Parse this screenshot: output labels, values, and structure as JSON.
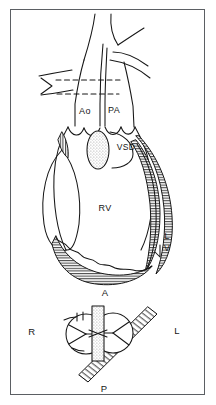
{
  "figure": {
    "caption": "",
    "border_color": "#5b5f63",
    "ink_color": "#161616",
    "background_color": "#ffffff",
    "hatch_color": "#2b2b2b",
    "stipple_color": "#9a9a9a"
  },
  "upper_panel": {
    "name": "heart-anterior-view",
    "labels": [
      {
        "id": "ao",
        "text": "Ao",
        "x": 85,
        "y": 112,
        "meaning": "aorta"
      },
      {
        "id": "pa",
        "text": "PA",
        "x": 114,
        "y": 111,
        "meaning": "pulmonary-artery"
      },
      {
        "id": "vsd",
        "text": "VSD",
        "x": 126,
        "y": 148,
        "meaning": "ventricular-septal-defect"
      },
      {
        "id": "rv",
        "text": "RV",
        "x": 105,
        "y": 209,
        "meaning": "right-ventricle"
      }
    ],
    "stacked_labels": [
      {
        "id": "lv",
        "lines": [
          "L",
          "V"
        ],
        "x": 167,
        "y": 243,
        "meaning": "left-ventricle"
      }
    ],
    "markers": [
      {
        "id": "level-arrow",
        "shape": "chevron-right",
        "x": 46,
        "y": 85,
        "meaning": "section-level-indicator"
      },
      {
        "id": "dashed-plane-upper",
        "shape": "dashed-line",
        "meaning": "sectioning-plane"
      },
      {
        "id": "dashed-plane-lower",
        "shape": "dashed-line",
        "meaning": "sectioning-plane"
      }
    ]
  },
  "lower_panel": {
    "name": "valve-cross-section-view",
    "orientation_labels": [
      {
        "id": "anterior",
        "text": "A",
        "x": 105,
        "y": 293,
        "meaning": "anterior"
      },
      {
        "id": "right",
        "text": "R",
        "x": 32,
        "y": 332,
        "meaning": "right"
      },
      {
        "id": "left",
        "text": "L",
        "x": 177,
        "y": 331,
        "meaning": "left"
      },
      {
        "id": "posterior",
        "text": "P",
        "x": 104,
        "y": 389,
        "meaning": "posterior"
      }
    ],
    "elements": [
      {
        "id": "valve-circle-right",
        "shape": "circle-trileaflet",
        "meaning": "semilunar-valve-right"
      },
      {
        "id": "valve-circle-left",
        "shape": "circle-trileaflet",
        "meaning": "semilunar-valve-left"
      },
      {
        "id": "septal-bar",
        "shape": "vertical-stippled-bar",
        "meaning": "septum-orientation"
      },
      {
        "id": "diagonal-band",
        "shape": "diagonal-hatched-band",
        "meaning": "outflow-tract-plane"
      }
    ]
  }
}
